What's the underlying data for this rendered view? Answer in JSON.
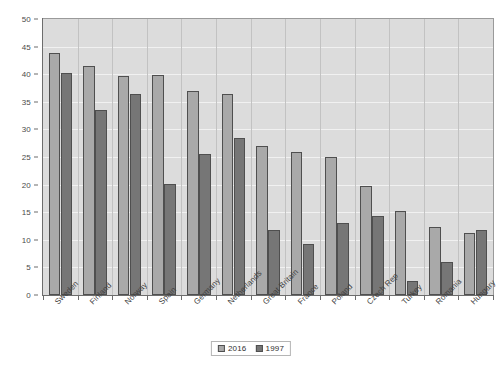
{
  "chart_data": {
    "type": "bar",
    "title": "",
    "xlabel": "",
    "ylabel": "",
    "ylim": [
      0,
      50
    ],
    "ytick_step": 5,
    "yticks": [
      "0",
      "5",
      "10",
      "15",
      "20",
      "25",
      "30",
      "35",
      "40",
      "45",
      "50"
    ],
    "grid": true,
    "legend_position": "bottom-center",
    "categories": [
      "Sweden",
      "Finland",
      "Norway",
      "Spain",
      "Germany",
      "Netherlands",
      "Great Britain",
      "France",
      "Poland",
      "Czech Rep",
      "Turkey",
      "Romania",
      "Hungary"
    ],
    "series": [
      {
        "name": "2016",
        "color": "#a9a9a9",
        "values": [
          43.8,
          41.5,
          39.7,
          39.8,
          37.0,
          36.5,
          27.0,
          26.0,
          25.0,
          19.8,
          15.2,
          12.3,
          11.2
        ]
      },
      {
        "name": "1997",
        "color": "#767676",
        "values": [
          40.3,
          33.5,
          36.4,
          20.1,
          25.5,
          28.5,
          11.8,
          9.2,
          13.0,
          14.3,
          2.5,
          5.9,
          11.8
        ]
      }
    ]
  },
  "legend": {
    "items": [
      {
        "label": "2016"
      },
      {
        "label": "1997"
      }
    ]
  },
  "colors": {
    "series_2016": "#a9a9a9",
    "series_1997": "#767676",
    "plot_background": "#dcdcdc",
    "gridline": "#f1f1f1",
    "axis": "#6d6d6d",
    "bar_outline": "#4f4f4f",
    "page_background": "#ffffff"
  }
}
